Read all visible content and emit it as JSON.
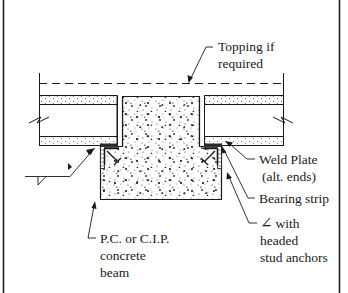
{
  "diagram": {
    "type": "structural-connection-detail",
    "colors": {
      "line": "#1a1a1a",
      "background": "#ffffff",
      "border": "#222222"
    },
    "labels": {
      "topping": {
        "line1": "Topping if",
        "line2": "required"
      },
      "weld_plate": {
        "line1": "Weld Plate",
        "line2": "(alt. ends)"
      },
      "bearing_strip": {
        "line1": "Bearing strip"
      },
      "angle": {
        "symbol": "∠",
        "line1": "with",
        "line2": "headed",
        "line3": "stud anchors"
      },
      "beam": {
        "line1": "P.C. or C.I.P.",
        "line2": "concrete",
        "line3": "beam"
      }
    },
    "elements": [
      "topping-dashed-line",
      "left-hollow-core-slab",
      "right-hollow-core-slab",
      "concrete-beam-stem",
      "concrete-beam-ledge",
      "left-bearing-strip",
      "right-bearing-strip",
      "left-weld-plate",
      "right-weld-plate",
      "left-steel-angle",
      "right-steel-angle",
      "weld-symbol",
      "break-lines"
    ]
  }
}
